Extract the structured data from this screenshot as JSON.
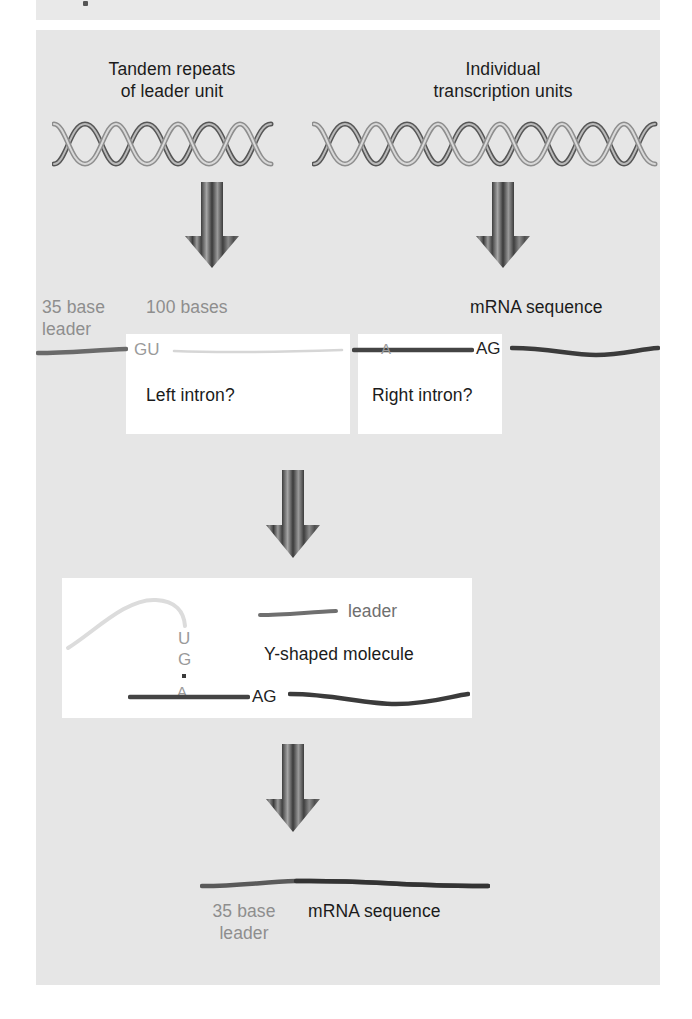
{
  "figure": {
    "type": "diagram",
    "background_panel_color": "#e6e6e6",
    "callout_box_color": "#ffffff",
    "dark_strand_color": "#333333",
    "gray_strand_color": "#9a9a9a",
    "light_strand_color": "#d0d0d0"
  },
  "headings": {
    "left": {
      "line1": "Tandem repeats",
      "line2": "of leader unit"
    },
    "right": {
      "line1": "Individual",
      "line2": "transcription units"
    }
  },
  "helices": {
    "left": {
      "turns": 5,
      "label": "dna-double-helix-left"
    },
    "right": {
      "turns": 8,
      "label": "dna-double-helix-right"
    }
  },
  "arrows": {
    "count": 4,
    "style": "striped-down-arrow",
    "labels": [
      "arrow-transcription-left",
      "arrow-transcription-right",
      "arrow-splicing",
      "arrow-ligation"
    ]
  },
  "row_transcripts": {
    "leader_label": {
      "line1": "35 base",
      "line2": "leader"
    },
    "intron_length": "100 bases",
    "mrna_label": "mRNA sequence",
    "donor_site": "GU",
    "branch_point": "A",
    "acceptor_site": "AG",
    "left_box_text": "Left intron?",
    "right_box_text": "Right intron?"
  },
  "y_molecule": {
    "title": "Y-shaped molecule",
    "legend_label": "leader",
    "branch_u": "U",
    "branch_g": "G",
    "branch_a": "A",
    "acceptor_site": "AG"
  },
  "result": {
    "leader_label": {
      "line1": "35 base",
      "line2": "leader"
    },
    "mrna_label": "mRNA sequence"
  }
}
